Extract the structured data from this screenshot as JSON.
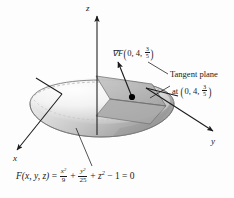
{
  "figure": {
    "background_color": "#fdfdfd",
    "ink_color": "#1a1a1a"
  },
  "axes": {
    "z": {
      "label": "z"
    },
    "x": {
      "label": "x"
    },
    "y": {
      "label": "y"
    }
  },
  "annotations": {
    "gradient": {
      "symbol": "∇F",
      "open_paren": "(",
      "args_prefix": "0, 4, ",
      "frac_num": "3",
      "frac_den": "5",
      "close_paren": ")",
      "full_text": "∇F(0, 4, 3/5)"
    },
    "tangent_plane": {
      "line1": "Tangent plane",
      "line2_prefix": "at ",
      "open_paren": "(",
      "args_prefix": "0, 4, ",
      "frac_num": "3",
      "frac_den": "5",
      "close_paren": ")",
      "full_text": "Tangent plane at (0, 4, 3/5)"
    }
  },
  "equation": {
    "lhs": "F(x, y, z)",
    "eq1": " = ",
    "term1_num": "x",
    "term1_num_exp": "2",
    "term1_den": "9",
    "plus1": " + ",
    "term2_num": "y",
    "term2_num_exp": "2",
    "term2_den": "25",
    "plus2": " + ",
    "term3": "z",
    "term3_exp": "2",
    "minus": " − 1 ",
    "eq2": "= 0",
    "full_text": "F(x, y, z) = x²/9 + y²/25 + z² − 1 = 0"
  },
  "surface": {
    "type": "ellipsoid",
    "semi_axis_x": 3,
    "semi_axis_y": 5,
    "semi_axis_z": 1,
    "shading": "grayscale-gradient",
    "highlight_color": "#ffffff",
    "shadow_color": "#9a9a9a"
  },
  "tangent_plane_shape": {
    "fill_color": "#b6b6b6",
    "edge_color": "#6e6e6e"
  },
  "tangency_point": {
    "x": 0,
    "y": 4,
    "z": 0.6,
    "marker_color": "#000000"
  },
  "gradient_vector": {
    "arrow_color": "#1a1a1a",
    "direction": "up-left"
  }
}
